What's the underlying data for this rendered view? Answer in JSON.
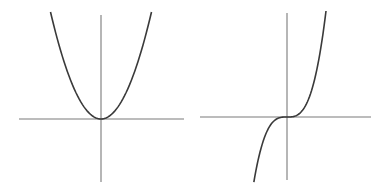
{
  "chart_data": [
    {
      "type": "line",
      "title": "",
      "function": "y = x^2",
      "xlabel": "",
      "ylabel": "",
      "x": [
        -1.0,
        -0.8,
        -0.6,
        -0.4,
        -0.2,
        0.0,
        0.2,
        0.4,
        0.6,
        0.8,
        1.0
      ],
      "values": [
        1.0,
        0.64,
        0.36,
        0.16,
        0.04,
        0.0,
        0.04,
        0.16,
        0.36,
        0.64,
        1.0
      ],
      "grid": false,
      "ticks": false,
      "legend": null
    },
    {
      "type": "line",
      "title": "",
      "function": "y = x^3",
      "xlabel": "",
      "ylabel": "",
      "x": [
        -0.75,
        -0.6,
        -0.4,
        -0.2,
        0.0,
        0.2,
        0.4,
        0.6,
        0.8,
        1.0
      ],
      "values": [
        -0.42,
        -0.216,
        -0.064,
        -0.008,
        0.0,
        0.008,
        0.064,
        0.216,
        0.512,
        1.0
      ],
      "grid": false,
      "ticks": false,
      "legend": null
    }
  ],
  "plots": {
    "left": {
      "axes": {
        "x_from": 19,
        "x_to": 184,
        "x_axis_y": 119,
        "y_axis_x": 101,
        "y_from": 15,
        "y_to": 182
      },
      "curve_color": "#3a3a3a",
      "axis_color": "#7a7a7a"
    },
    "right": {
      "axes": {
        "x_from": 200,
        "x_to": 371,
        "x_axis_y": 117,
        "y_axis_x": 287,
        "y_from": 13,
        "y_to": 180
      },
      "curve_color": "#3a3a3a",
      "axis_color": "#7a7a7a"
    }
  }
}
